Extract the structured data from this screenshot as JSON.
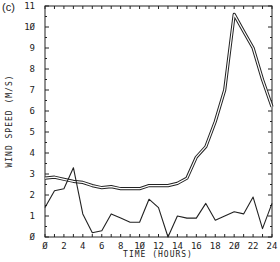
{
  "panel_label": "(c)",
  "chart_data": {
    "type": "line",
    "title": "",
    "panel": "(c)",
    "xlabel": "TIME (HOURS)",
    "ylabel": "WIND SPEED (M/S)",
    "xlim": [
      0,
      24
    ],
    "ylim": [
      0,
      11
    ],
    "x_ticks": [
      0,
      2,
      4,
      6,
      8,
      10,
      12,
      14,
      16,
      18,
      20,
      22,
      24
    ],
    "x_tick_labels": [
      "Ø",
      "2",
      "4",
      "6",
      "8",
      "1Ø",
      "12",
      "14",
      "16",
      "18",
      "2Ø",
      "22",
      "24"
    ],
    "y_ticks": [
      0,
      1,
      2,
      3,
      4,
      5,
      6,
      7,
      8,
      9,
      10,
      11
    ],
    "y_tick_labels": [
      "Ø",
      "1",
      "2",
      "3",
      "4",
      "5",
      "6",
      "7",
      "8",
      "9",
      "1Ø",
      "11"
    ],
    "grid": false,
    "legend": null,
    "x": [
      0,
      1,
      2,
      3,
      4,
      5,
      6,
      7,
      8,
      9,
      10,
      11,
      12,
      13,
      14,
      15,
      16,
      17,
      18,
      19,
      20,
      21,
      22,
      23,
      24
    ],
    "series": [
      {
        "name": "double line (upper)",
        "style": "double",
        "values": [
          2.8,
          2.85,
          2.75,
          2.65,
          2.6,
          2.45,
          2.35,
          2.4,
          2.3,
          2.3,
          2.3,
          2.45,
          2.45,
          2.45,
          2.55,
          2.8,
          3.8,
          4.3,
          5.5,
          7.0,
          10.6,
          9.8,
          9.0,
          7.5,
          6.2
        ]
      },
      {
        "name": "single line (lower)",
        "style": "single",
        "values": [
          1.4,
          2.2,
          2.3,
          3.3,
          1.1,
          0.2,
          0.3,
          1.1,
          0.9,
          0.7,
          0.7,
          1.8,
          1.4,
          0.0,
          1.0,
          0.9,
          0.9,
          1.6,
          0.8,
          1.0,
          1.2,
          1.1,
          1.9,
          0.4,
          1.6
        ]
      }
    ]
  }
}
